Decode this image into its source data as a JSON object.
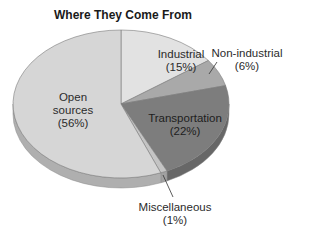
{
  "chart_data": {
    "type": "pie",
    "title": "Where They Come From",
    "style": "3d-pie",
    "start_angle_deg": -90,
    "direction": "clockwise",
    "slices": [
      {
        "label": "Industrial",
        "pct_label": "(15%)",
        "value": 15,
        "color": "#e2e2e2"
      },
      {
        "label": "Non-industrial",
        "pct_label": "(6%)",
        "value": 6,
        "color": "#a9a9a9"
      },
      {
        "label": "Transportation",
        "pct_label": "(22%)",
        "value": 22,
        "color": "#7d7d7d"
      },
      {
        "label": "Miscellaneous",
        "pct_label": "(1%)",
        "value": 1,
        "color": "#c4c4c4"
      },
      {
        "label": "Open sources",
        "pct_label": "(56%)",
        "value": 56,
        "color": "#d6d6d6"
      }
    ],
    "legend": "none (labels placed on/near slices)"
  },
  "labels": {
    "industrial": {
      "line1": "Industrial",
      "line2": "(15%)"
    },
    "nonindustrial": {
      "line1": "Non-industrial",
      "line2": "(6%)"
    },
    "transportation": {
      "line1": "Transportation",
      "line2": "(22%)"
    },
    "misc": {
      "line1": "Miscellaneous",
      "line2": "(1%)"
    },
    "open": {
      "line1": "Open",
      "line2": "sources",
      "line3": "(56%)"
    }
  }
}
